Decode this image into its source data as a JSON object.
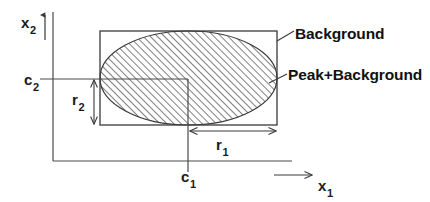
{
  "figure": {
    "type": "diagram",
    "background_color": "#ffffff",
    "line_color": "#3a3a3a",
    "text_color": "#1a1a1a",
    "hatch_color": "#555555"
  },
  "axes": {
    "vertical": {
      "name": "x2-axis",
      "label_base": "x",
      "label_sub": "2",
      "arrow_direction": "up"
    },
    "horizontal": {
      "name": "x1-axis",
      "label_base": "x",
      "label_sub": "1",
      "arrow_direction": "right"
    }
  },
  "regions": {
    "background_box": {
      "callout": "Background",
      "shape": "rectangle"
    },
    "peak_box": {
      "callout": "Peak+Background",
      "shape": "ellipse",
      "fill": "diagonal-hatch"
    }
  },
  "markers": {
    "center_x": {
      "label_base": "c",
      "label_sub": "1",
      "meaning": "ellipse centre along x1"
    },
    "center_y": {
      "label_base": "c",
      "label_sub": "2",
      "meaning": "ellipse centre along x2"
    },
    "radius_x": {
      "label_base": "r",
      "label_sub": "1",
      "meaning": "semi-axis along x1"
    },
    "radius_y": {
      "label_base": "r",
      "label_sub": "2",
      "meaning": "semi-axis along x2"
    }
  }
}
